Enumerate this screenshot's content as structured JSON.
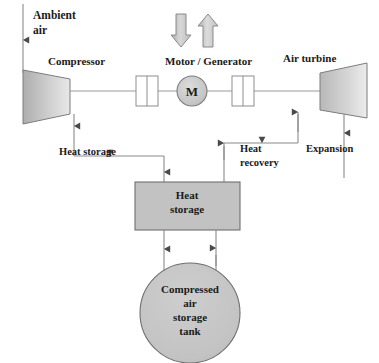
{
  "diagram": {
    "background_color": "#ffffff",
    "line_color": "#8a8a8a",
    "text_color": "#1a1a1a",
    "fill_color": "#c2c2c2",
    "labels": {
      "ambient_air_line1": "Ambient",
      "ambient_air_line2": "air",
      "compressor": "Compressor",
      "motor_generator": "Motor / Generator",
      "motor_symbol": "M",
      "air_turbine": "Air turbine",
      "heat_storage_path": "Heat storage",
      "heat_recovery_line1": "Heat",
      "heat_recovery_line2": "recovery",
      "expansion": "Expansion",
      "heat_storage_box_line1": "Heat",
      "heat_storage_box_line2": "storage",
      "tank_line1": "Compressed",
      "tank_line2": "air",
      "tank_line3": "storage",
      "tank_line4": "tank"
    },
    "components": [
      {
        "id": "compressor",
        "type": "trapezoid",
        "label": "Compressor"
      },
      {
        "id": "clutch-left",
        "type": "clutch",
        "label": ""
      },
      {
        "id": "motor-generator",
        "type": "circle",
        "label": "M"
      },
      {
        "id": "clutch-right",
        "type": "clutch",
        "label": ""
      },
      {
        "id": "air-turbine",
        "type": "trapezoid",
        "label": "Air turbine"
      },
      {
        "id": "heat-storage",
        "type": "rectangle",
        "label": "Heat storage"
      },
      {
        "id": "compressed-air-storage-tank",
        "type": "circle",
        "label": "Compressed air storage tank"
      }
    ],
    "flow_arrows": [
      {
        "id": "ambient-air-inlet",
        "direction": "down"
      },
      {
        "id": "electricity-in",
        "direction": "down"
      },
      {
        "id": "electricity-out",
        "direction": "up"
      },
      {
        "id": "compressor-heat-to-storage",
        "direction": "right-down"
      },
      {
        "id": "storage-heat-to-turbine",
        "direction": "up-right-up"
      },
      {
        "id": "turbine-exhaust",
        "direction": "down"
      },
      {
        "id": "air-to-tank",
        "direction": "down"
      },
      {
        "id": "air-from-tank",
        "direction": "up"
      }
    ]
  }
}
